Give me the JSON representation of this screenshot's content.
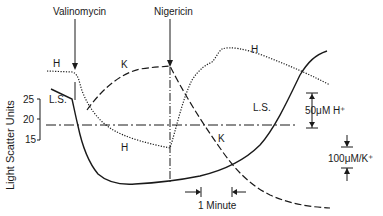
{
  "diagram": {
    "ylabel": "Light Scatter Units",
    "yticks": [
      "25",
      "20",
      "15"
    ],
    "annotations": {
      "valinomycin": "Valinomycin",
      "nigericin": "Nigericin",
      "time_scale": "1 Minute",
      "h_scale": "50μM H⁺",
      "k_scale": "100μM/K⁺"
    },
    "curve_labels": {
      "h_left": "H",
      "h_bottom": "H",
      "h_right": "H",
      "k_top": "K",
      "k_bottom": "K",
      "ls_left": "L.S.",
      "ls_right": "L.S."
    },
    "series": [
      {
        "name": "H",
        "style": "dotted"
      },
      {
        "name": "K",
        "style": "dashed"
      },
      {
        "name": "L.S.",
        "style": "solid"
      },
      {
        "name": "baseline",
        "style": "dash-dot"
      }
    ]
  }
}
